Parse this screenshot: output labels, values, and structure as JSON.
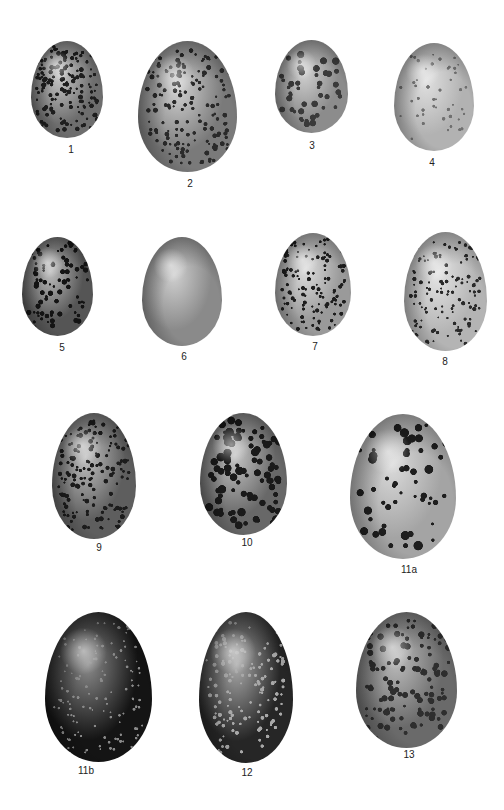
{
  "plate": {
    "eggs": [
      {
        "label": "1",
        "x": 31,
        "y": 41,
        "w": 72,
        "h": 97,
        "base": "#6e6e6e",
        "spot": "#1e1e1e",
        "light": "#c8c8c8",
        "pattern": "dense-fine",
        "label_x": 71,
        "label_y": 144
      },
      {
        "label": "2",
        "x": 138,
        "y": 41,
        "w": 99,
        "h": 131,
        "base": "#7a7a7a",
        "spot": "#2a2a2a",
        "light": "#d2d2d2",
        "pattern": "dense-fine",
        "label_x": 190,
        "label_y": 178
      },
      {
        "label": "3",
        "x": 275,
        "y": 40,
        "w": 73,
        "h": 93,
        "base": "#8c8c8c",
        "spot": "#3a3a3a",
        "light": "#d0d0d0",
        "pattern": "blotched-cap",
        "label_x": 312,
        "label_y": 140
      },
      {
        "label": "4",
        "x": 394,
        "y": 43,
        "w": 80,
        "h": 108,
        "base": "#b2b2b2",
        "spot": "#707070",
        "light": "#e0e0e0",
        "pattern": "sparse-fine",
        "label_x": 432,
        "label_y": 157
      },
      {
        "label": "5",
        "x": 22,
        "y": 237,
        "w": 71,
        "h": 99,
        "base": "#555555",
        "spot": "#141414",
        "light": "#bdbdbd",
        "pattern": "spotted",
        "label_x": 62,
        "label_y": 342
      },
      {
        "label": "6",
        "x": 142,
        "y": 237,
        "w": 80,
        "h": 109,
        "base": "#8a8a8a",
        "spot": "#8a8a8a",
        "light": "#cfcfcf",
        "pattern": "plain",
        "label_x": 184,
        "label_y": 351
      },
      {
        "label": "7",
        "x": 275,
        "y": 233,
        "w": 76,
        "h": 103,
        "base": "#9a9a9a",
        "spot": "#1e1e1e",
        "light": "#dcdcdc",
        "pattern": "speckled",
        "label_x": 315,
        "label_y": 341
      },
      {
        "label": "8",
        "x": 404,
        "y": 232,
        "w": 83,
        "h": 119,
        "base": "#b4b4b4",
        "spot": "#2a2a2a",
        "light": "#e4e4e4",
        "pattern": "speckled",
        "label_x": 445,
        "label_y": 356
      },
      {
        "label": "9",
        "x": 52,
        "y": 413,
        "w": 84,
        "h": 126,
        "base": "#5e5e5e",
        "spot": "#1c1c1c",
        "light": "#c0c0c0",
        "pattern": "dense-fine",
        "label_x": 99,
        "label_y": 542
      },
      {
        "label": "10",
        "x": 200,
        "y": 413,
        "w": 87,
        "h": 122,
        "base": "#686868",
        "spot": "#1a1a1a",
        "light": "#c4c4c4",
        "pattern": "blotched",
        "label_x": 247,
        "label_y": 537
      },
      {
        "label": "11a",
        "x": 350,
        "y": 414,
        "w": 106,
        "h": 145,
        "base": "#a4a4a4",
        "spot": "#1e1e1e",
        "light": "#dadada",
        "pattern": "large-blotch",
        "label_x": 409,
        "label_y": 564
      },
      {
        "label": "11b",
        "x": 45,
        "y": 612,
        "w": 107,
        "h": 150,
        "base": "#141414",
        "spot": "#0a0a0a",
        "light": "#8a8a8a",
        "pattern": "dark-fleck",
        "label_x": 86,
        "label_y": 765
      },
      {
        "label": "12",
        "x": 199,
        "y": 612,
        "w": 94,
        "h": 151,
        "base": "#262626",
        "spot": "#0e0e0e",
        "light": "#a8a8a8",
        "pattern": "dark-marbled",
        "label_x": 247,
        "label_y": 767
      },
      {
        "label": "13",
        "x": 356,
        "y": 612,
        "w": 101,
        "h": 136,
        "base": "#6a6a6a",
        "spot": "#2e2e2e",
        "light": "#bcbcbc",
        "pattern": "mottled",
        "label_x": 409,
        "label_y": 749
      }
    ]
  }
}
